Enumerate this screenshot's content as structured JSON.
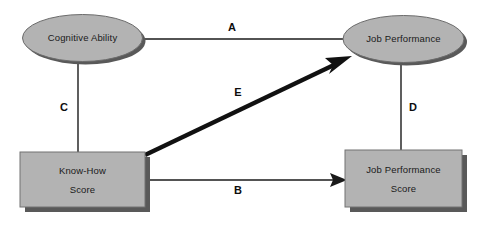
{
  "diagram": {
    "background_color": "#ffffff",
    "shape_fill": "#b3b3b3",
    "shape_stroke": "#4d4d4d",
    "shadow_color": "#595959",
    "line_color": "#1a1a1a",
    "nodes": [
      {
        "id": "cognitive-ability",
        "shape": "ellipse",
        "label": "Cognitive Ability",
        "cx": 82.5,
        "cy": 38,
        "rx": 60,
        "ry": 24
      },
      {
        "id": "job-performance",
        "shape": "ellipse",
        "label": "Job Performance",
        "cx": 403.5,
        "cy": 39,
        "rx": 61,
        "ry": 24
      },
      {
        "id": "know-how-score",
        "shape": "rect",
        "label_line1": "Know-How",
        "label_line2": "Score",
        "x": 20,
        "y": 152,
        "width": 125,
        "height": 55
      },
      {
        "id": "job-performance-score",
        "shape": "rect",
        "label_line1": "Job Performance",
        "label_line2": "Score",
        "x": 345,
        "y": 150,
        "width": 117,
        "height": 57
      }
    ],
    "paths": [
      {
        "id": "path-a",
        "label": "A",
        "from": "cognitive-ability",
        "to": "job-performance",
        "style": "line",
        "arrow": false,
        "label_x": 232,
        "label_y": 28
      },
      {
        "id": "path-b",
        "label": "B",
        "from": "know-how-score",
        "to": "job-performance-score",
        "style": "arrow",
        "arrow": true,
        "label_x": 238,
        "label_y": 191
      },
      {
        "id": "path-c",
        "label": "C",
        "from": "cognitive-ability",
        "to": "know-how-score",
        "style": "line",
        "arrow": false,
        "label_x": 64,
        "label_y": 108
      },
      {
        "id": "path-d",
        "label": "D",
        "from": "job-performance",
        "to": "job-performance-score",
        "style": "line",
        "arrow": false,
        "label_x": 413,
        "label_y": 108
      },
      {
        "id": "path-e",
        "label": "E",
        "from": "know-how-score",
        "to": "job-performance",
        "style": "thick-arrow",
        "arrow": true,
        "label_x": 238,
        "label_y": 93
      }
    ]
  }
}
